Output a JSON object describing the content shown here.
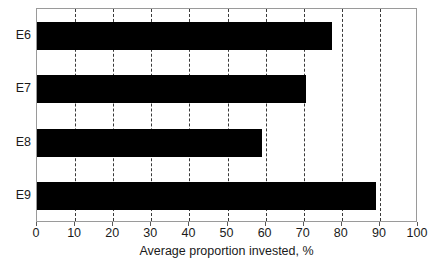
{
  "chart_data": {
    "type": "bar",
    "orientation": "horizontal",
    "title": "",
    "subtitle": "",
    "xlabel": "Average proportion invested, %",
    "ylabel": "",
    "categories": [
      "E6",
      "E7",
      "E8",
      "E9"
    ],
    "values": [
      77.5,
      70.5,
      59,
      89
    ],
    "series": [
      {
        "name": "Average proportion invested",
        "values": [
          77.5,
          70.5,
          59,
          89
        ]
      }
    ],
    "xlim": [
      0,
      100
    ],
    "xticks": [
      0,
      10,
      20,
      30,
      40,
      50,
      60,
      70,
      80,
      90,
      100
    ],
    "xtick_labels": [
      "0",
      "10",
      "20",
      "30",
      "40",
      "50",
      "60",
      "70",
      "80",
      "90",
      "100"
    ],
    "grid": true,
    "grid_axis": "x",
    "grid_style": "dashed",
    "legend": false,
    "legend_position": "none",
    "bar_color": "#000000",
    "grid_color": "#3a3a3a",
    "frame_color": "#9a9a9a",
    "background_color": "#ffffff",
    "text_color": "#1a1a1a"
  }
}
